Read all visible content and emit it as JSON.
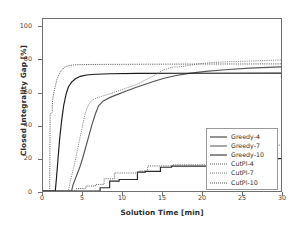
{
  "chart_data": {
    "type": "line",
    "title": "",
    "xlabel": "Solution Time [min]",
    "ylabel": "Closed Integrality Gap [%]",
    "xlim": [
      0,
      30
    ],
    "ylim": [
      0,
      105
    ],
    "xticks": [
      0,
      5,
      10,
      15,
      20,
      25,
      30
    ],
    "yticks": [
      0,
      20,
      40,
      60,
      80,
      100
    ],
    "grid": false,
    "legend_position": "lower right",
    "series": [
      {
        "name": "Greedy-4",
        "style": "solid",
        "color": "#2b2b2b",
        "points": [
          [
            0,
            0
          ],
          [
            7.2,
            0
          ],
          [
            7.2,
            2.0
          ],
          [
            8.4,
            2.0
          ],
          [
            8.4,
            6.0
          ],
          [
            9.6,
            6.0
          ],
          [
            9.6,
            7.0
          ],
          [
            11.9,
            7.0
          ],
          [
            11.9,
            11.5
          ],
          [
            12.9,
            11.5
          ],
          [
            12.9,
            12.0
          ],
          [
            14.8,
            12.0
          ],
          [
            14.8,
            14.5
          ],
          [
            16.2,
            14.5
          ],
          [
            16.2,
            15.2
          ],
          [
            22.4,
            15.2
          ],
          [
            22.4,
            19.8
          ],
          [
            30,
            19.8
          ]
        ]
      },
      {
        "name": "Greedy-7",
        "style": "solid",
        "color": "#555555",
        "points": [
          [
            0,
            0
          ],
          [
            3.6,
            0
          ],
          [
            3.8,
            4
          ],
          [
            4.2,
            9
          ],
          [
            4.6,
            14
          ],
          [
            5.0,
            20
          ],
          [
            5.4,
            27
          ],
          [
            5.8,
            34
          ],
          [
            6.2,
            41
          ],
          [
            6.6,
            47
          ],
          [
            7.0,
            52
          ],
          [
            7.6,
            55
          ],
          [
            8.4,
            57
          ],
          [
            9.4,
            59
          ],
          [
            10.5,
            61
          ],
          [
            11.6,
            63
          ],
          [
            12.8,
            65
          ],
          [
            14.0,
            67
          ],
          [
            15.4,
            69
          ],
          [
            16.8,
            70.5
          ],
          [
            18.4,
            71.8
          ],
          [
            20.5,
            73
          ],
          [
            23,
            74
          ],
          [
            26,
            75
          ],
          [
            30,
            75.8
          ]
        ]
      },
      {
        "name": "Greedy-10",
        "style": "solid",
        "color": "#1a1a1a",
        "points": [
          [
            0,
            0
          ],
          [
            1.55,
            0
          ],
          [
            1.7,
            8
          ],
          [
            1.9,
            20
          ],
          [
            2.1,
            32
          ],
          [
            2.35,
            43
          ],
          [
            2.6,
            52
          ],
          [
            2.9,
            59
          ],
          [
            3.2,
            63.5
          ],
          [
            3.6,
            66.5
          ],
          [
            4.1,
            68.5
          ],
          [
            4.7,
            70
          ],
          [
            5.5,
            70.8
          ],
          [
            6.6,
            71.3
          ],
          [
            8.5,
            71.6
          ],
          [
            12,
            71.8
          ],
          [
            18,
            71.9
          ],
          [
            30,
            72
          ]
        ]
      },
      {
        "name": "CutPl-4",
        "style": "dotted",
        "color": "#5a5a5a",
        "points": [
          [
            0,
            0
          ],
          [
            4.2,
            0
          ],
          [
            4.2,
            1.5
          ],
          [
            5.4,
            1.5
          ],
          [
            5.4,
            3.0
          ],
          [
            6.6,
            3.0
          ],
          [
            6.6,
            4.0
          ],
          [
            7.7,
            4.0
          ],
          [
            7.7,
            7.5
          ],
          [
            9.0,
            7.5
          ],
          [
            9.0,
            11.0
          ],
          [
            12.1,
            11.0
          ],
          [
            12.1,
            12.2
          ],
          [
            13.2,
            12.2
          ],
          [
            13.2,
            15.3
          ],
          [
            16.3,
            15.3
          ],
          [
            16.3,
            16.0
          ],
          [
            21.8,
            16.0
          ],
          [
            21.8,
            21.0
          ],
          [
            22.6,
            21.0
          ],
          [
            22.6,
            22.5
          ],
          [
            28.5,
            22.5
          ],
          [
            28.5,
            28.0
          ],
          [
            30,
            28.0
          ]
        ]
      },
      {
        "name": "CutPl-7",
        "style": "dotted",
        "color": "#777777",
        "points": [
          [
            0,
            0
          ],
          [
            3.2,
            0
          ],
          [
            3.4,
            5
          ],
          [
            3.7,
            11
          ],
          [
            4.0,
            17
          ],
          [
            4.3,
            24
          ],
          [
            4.6,
            31
          ],
          [
            4.9,
            38
          ],
          [
            5.2,
            45
          ],
          [
            5.5,
            50
          ],
          [
            5.9,
            54
          ],
          [
            6.4,
            56
          ],
          [
            7.2,
            57.5
          ],
          [
            8.2,
            59
          ],
          [
            9.4,
            61
          ],
          [
            10.6,
            63
          ],
          [
            11.8,
            65
          ],
          [
            13.0,
            68
          ],
          [
            14.2,
            71
          ],
          [
            15.2,
            74
          ],
          [
            16.2,
            75.5
          ],
          [
            17.6,
            76
          ],
          [
            19.4,
            77.5
          ],
          [
            21.5,
            78.5
          ],
          [
            24,
            79
          ],
          [
            27,
            79.5
          ],
          [
            30,
            80
          ]
        ]
      },
      {
        "name": "CutPl-10",
        "style": "dotted",
        "color": "#4a4a4a",
        "points": [
          [
            0,
            0
          ],
          [
            0.85,
            0
          ],
          [
            0.85,
            8
          ],
          [
            0.9,
            47
          ],
          [
            1.15,
            48
          ],
          [
            1.2,
            55
          ],
          [
            1.35,
            60
          ],
          [
            1.55,
            64
          ],
          [
            1.75,
            68
          ],
          [
            2.0,
            71
          ],
          [
            2.3,
            73.5
          ],
          [
            2.7,
            75.5
          ],
          [
            3.2,
            76.5
          ],
          [
            3.9,
            77
          ],
          [
            5.2,
            77.2
          ],
          [
            8,
            77.3
          ],
          [
            13,
            77.4
          ],
          [
            20,
            77.5
          ],
          [
            30,
            77.6
          ]
        ]
      }
    ],
    "legend": [
      {
        "label": "Greedy-4",
        "style": "solid",
        "color": "#2b2b2b"
      },
      {
        "label": "Greedy-7",
        "style": "solid",
        "color": "#555555"
      },
      {
        "label": "Greedy-10",
        "style": "solid",
        "color": "#1a1a1a"
      },
      {
        "label": "CutPl-4",
        "style": "dotted",
        "color": "#5a5a5a"
      },
      {
        "label": "CutPl-7",
        "style": "dotted",
        "color": "#777777"
      },
      {
        "label": "CutPl-10",
        "style": "dotted",
        "color": "#4a4a4a"
      }
    ]
  }
}
